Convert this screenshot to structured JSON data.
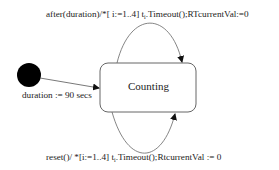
{
  "diagram": {
    "type": "state-machine",
    "initial_node": {
      "label": "duration := 90 secs"
    },
    "states": [
      {
        "id": "counting",
        "label": "Counting"
      }
    ],
    "transitions": [
      {
        "from": "initial",
        "to": "counting",
        "label": "duration := 90 secs"
      },
      {
        "from": "counting",
        "to": "counting",
        "position": "top",
        "label_pre": "after(duration)/*[ i:=1..4] t",
        "label_sub": "i",
        "label_post": ".Timeout();RTcurrentVal:=0"
      },
      {
        "from": "counting",
        "to": "counting",
        "position": "bottom",
        "label_pre": "reset()/ *[i:=1..4] t",
        "label_sub": "i",
        "label_post": ".Timeout();RtcurrentVal := 0"
      }
    ]
  },
  "colors": {
    "line": "#555555",
    "initial_fill": "#000000",
    "text": "#222222",
    "background": "#ffffff"
  }
}
